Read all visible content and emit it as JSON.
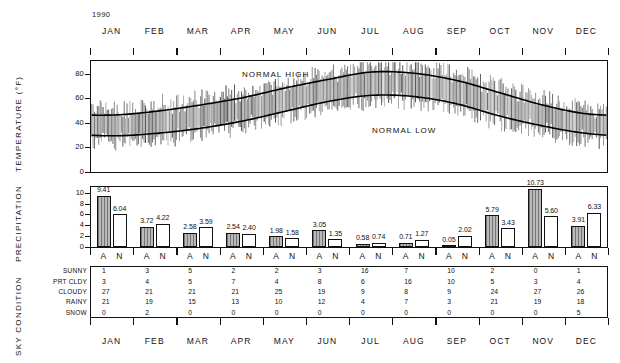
{
  "year": "1990",
  "axis_titles": {
    "temperature": "TEMPERATURE (°F)",
    "precipitation": "PRECIPITATION",
    "sky": "SKY CONDITION"
  },
  "months": [
    "JAN",
    "FEB",
    "MAR",
    "APR",
    "MAY",
    "JUN",
    "JUL",
    "AUG",
    "SEP",
    "OCT",
    "NOV",
    "DEC"
  ],
  "series_labels": {
    "normal_high": "NORMAL HIGH",
    "normal_low": "NORMAL LOW"
  },
  "bar_group_labels": {
    "actual": "A",
    "normal": "N"
  },
  "chart_data": [
    {
      "type": "line",
      "title": "Daily temperature range with normal high and low",
      "ylabel": "TEMPERATURE (°F)",
      "xlabel": "",
      "ylim": [
        0,
        90
      ],
      "yticks": [
        0,
        20,
        40,
        60,
        80
      ],
      "ytick_labels": [
        "0",
        "20",
        "40",
        "60",
        "80"
      ],
      "grid": false,
      "x": [
        "JAN",
        "FEB",
        "MAR",
        "APR",
        "MAY",
        "JUN",
        "JUL",
        "AUG",
        "SEP",
        "OCT",
        "NOV",
        "DEC"
      ],
      "series": [
        {
          "name": "NORMAL HIGH",
          "values": [
            46,
            49,
            54,
            60,
            68,
            75,
            81,
            80,
            74,
            64,
            54,
            47
          ]
        },
        {
          "name": "NORMAL LOW",
          "values": [
            29,
            31,
            35,
            41,
            49,
            57,
            62,
            61,
            55,
            45,
            37,
            31
          ]
        }
      ],
      "notes": "Thin vertical bars show each day's observed high-low range."
    },
    {
      "type": "bar",
      "title": "Monthly precipitation: actual vs normal",
      "ylabel": "PRECIPITATION",
      "xlabel": "",
      "ylim": [
        0,
        11
      ],
      "yticks": [
        0,
        2,
        4,
        6,
        8,
        10
      ],
      "ytick_labels": [
        "0",
        "2",
        "4",
        "6",
        "8",
        "10"
      ],
      "grid": false,
      "categories": [
        "JAN",
        "FEB",
        "MAR",
        "APR",
        "MAY",
        "JUN",
        "JUL",
        "AUG",
        "SEP",
        "OCT",
        "NOV",
        "DEC"
      ],
      "series": [
        {
          "name": "A",
          "values": [
            9.41,
            3.72,
            2.58,
            2.54,
            1.98,
            3.05,
            0.58,
            0.71,
            0.05,
            5.79,
            10.73,
            3.91
          ]
        },
        {
          "name": "N",
          "values": [
            6.04,
            4.22,
            3.59,
            2.4,
            1.58,
            1.35,
            0.74,
            1.27,
            2.02,
            3.43,
            5.6,
            6.33
          ]
        }
      ],
      "value_labels": [
        "9.41",
        "6.04",
        "3.72",
        "4.22",
        "2.58",
        "3.59",
        "2.54",
        "2.40",
        "1.98",
        "1.58",
        "3.05",
        "1.35",
        "0.58",
        "0.74",
        "0.71",
        "1.27",
        "0.05",
        "2.02",
        "5.79",
        "3.43",
        "10.73",
        "5.60",
        "3.91",
        "6.33"
      ]
    },
    {
      "type": "table",
      "title": "SKY CONDITION",
      "row_headers": [
        "SUNNY",
        "PRT CLDY",
        "CLOUDY",
        "RAINY",
        "SNOW"
      ],
      "columns": [
        "JAN",
        "FEB",
        "MAR",
        "APR",
        "MAY",
        "JUN",
        "JUL",
        "AUG",
        "SEP",
        "OCT",
        "NOV",
        "DEC"
      ],
      "rows": [
        {
          "label": "SUNNY",
          "values": [
            1,
            3,
            5,
            2,
            2,
            3,
            16,
            7,
            10,
            2,
            0,
            1
          ]
        },
        {
          "label": "PRT CLDY",
          "values": [
            3,
            4,
            5,
            7,
            4,
            8,
            6,
            16,
            10,
            5,
            3,
            4
          ]
        },
        {
          "label": "CLOUDY",
          "values": [
            27,
            21,
            21,
            21,
            25,
            19,
            9,
            8,
            9,
            24,
            27,
            26
          ]
        },
        {
          "label": "RAINY",
          "values": [
            21,
            19,
            15,
            13,
            10,
            12,
            4,
            7,
            3,
            21,
            19,
            18
          ]
        },
        {
          "label": "SNOW",
          "values": [
            0,
            2,
            0,
            0,
            0,
            0,
            0,
            0,
            0,
            0,
            0,
            5
          ]
        }
      ]
    }
  ],
  "colors": {
    "ink": "#111111",
    "actual_bar_fill": "#b9b9b9",
    "normal_bar_fill": "#ffffff",
    "background": "#ffffff"
  }
}
